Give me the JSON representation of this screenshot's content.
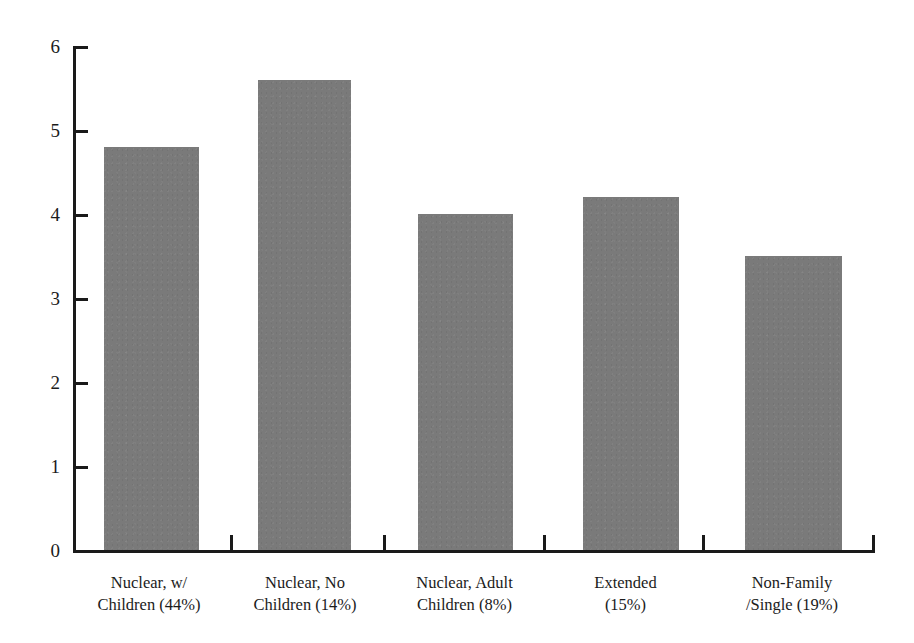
{
  "chart_data": {
    "type": "bar",
    "title": "",
    "subtitle": "",
    "xlabel": "",
    "ylabel": "",
    "categories": [
      "Nuclear, w/ Children (44%)",
      "Nuclear, No Children (14%)",
      "Nuclear, Adult Children (8%)",
      "Extended (15%)",
      "Non-Family /Single (19%)"
    ],
    "category_lines": [
      [
        "Nuclear, w/",
        "Children (44%)"
      ],
      [
        "Nuclear, No",
        "Children (14%)"
      ],
      [
        "Nuclear, Adult",
        "Children (8%)"
      ],
      [
        "Extended",
        "(15%)"
      ],
      [
        "Non-Family",
        "/Single (19%)"
      ]
    ],
    "values": [
      4.8,
      5.6,
      4.0,
      4.2,
      3.5
    ],
    "ylim": [
      0,
      6
    ],
    "yticks": [
      0,
      1,
      2,
      3,
      4,
      5,
      6
    ],
    "ytick_labels": [
      "0",
      "1",
      "2",
      "3",
      "4",
      "5",
      "6"
    ],
    "grid": false,
    "legend": false,
    "bar_color": "#7a7a7a",
    "axis_color": "#1a1a1a",
    "background_color": "#ffffff"
  }
}
